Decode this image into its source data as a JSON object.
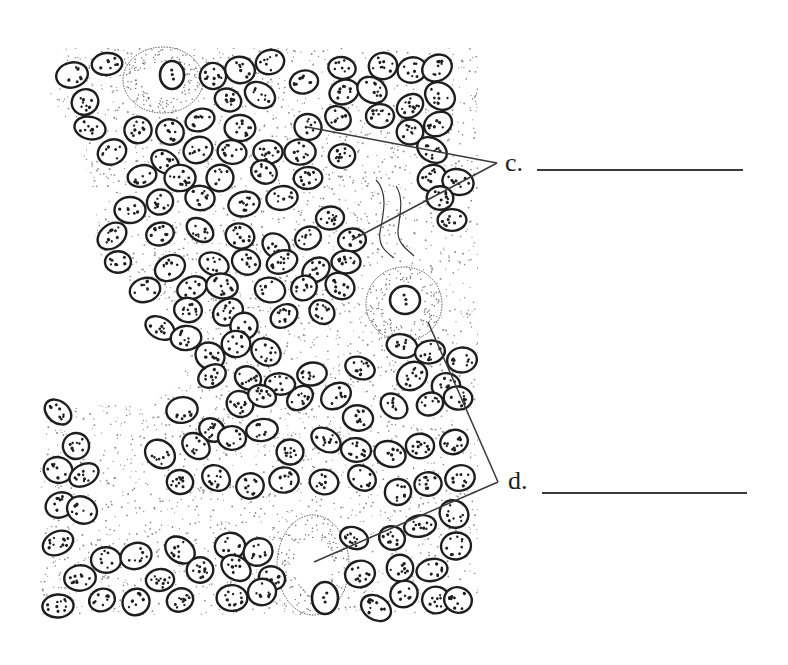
{
  "diagram": {
    "type": "labeled biological tissue illustration",
    "background_color": "#ffffff",
    "ink_color": "#1e1e1e",
    "stipple_color": "#8a8a8a",
    "labels": [
      {
        "id": "c",
        "text": "c.",
        "answer_blank": "",
        "x": 505,
        "y": 153,
        "points_to": [
          "small oval cell near top-center",
          "small oval cell center-right"
        ]
      },
      {
        "id": "d",
        "text": "d.",
        "answer_blank": "",
        "x": 508,
        "y": 472,
        "points_to": [
          "large irregular cell center-right",
          "large irregular cell bottom-center"
        ]
      }
    ],
    "leader_lines": {
      "c": {
        "apex": [
          497,
          163
        ],
        "targets": [
          [
            307,
            127
          ],
          [
            352,
            240
          ]
        ]
      },
      "d": {
        "apex": [
          498,
          482
        ],
        "targets": [
          [
            428,
            322
          ],
          [
            314,
            562
          ]
        ]
      }
    },
    "blank_lines": [
      {
        "label": "c",
        "x1": 537,
        "x2": 743,
        "y": 169
      },
      {
        "label": "d",
        "x1": 542,
        "x2": 747,
        "y": 492
      }
    ],
    "large_cells": [
      {
        "name": "large-cell-top-left",
        "cx": 163,
        "cy": 80,
        "rx": 40,
        "ry": 33,
        "nucleus": [
          172,
          75,
          12,
          14
        ]
      },
      {
        "name": "large-cell-center-right",
        "cx": 404,
        "cy": 304,
        "rx": 38,
        "ry": 37,
        "nucleus": [
          405,
          300,
          15,
          14
        ]
      },
      {
        "name": "large-cell-bottom",
        "cx": 313,
        "cy": 565,
        "rx": 36,
        "ry": 50,
        "nucleus": [
          325,
          598,
          13,
          16
        ]
      }
    ],
    "wavy_fibers": [
      "M376,180 C388,192 384,212 380,232 C378,246 386,252 394,258",
      "M396,186 C404,198 400,214 398,230 C397,244 408,250 414,256"
    ]
  }
}
